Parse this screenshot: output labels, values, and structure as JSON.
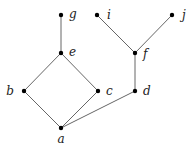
{
  "diagram": {
    "type": "hasse-diagram",
    "colors": {
      "edge": "#555555",
      "node": "#000000",
      "label": "#222222"
    },
    "nodes": [
      {
        "id": "a",
        "label": "a",
        "x": 61,
        "y": 128,
        "lx": 61,
        "ly": 143,
        "anchor": "middle"
      },
      {
        "id": "b",
        "label": "b",
        "x": 24,
        "y": 91,
        "lx": 14,
        "ly": 95,
        "anchor": "end"
      },
      {
        "id": "c",
        "label": "c",
        "x": 98,
        "y": 91,
        "lx": 106,
        "ly": 95,
        "anchor": "start"
      },
      {
        "id": "d",
        "label": "d",
        "x": 135,
        "y": 91,
        "lx": 143,
        "ly": 95,
        "anchor": "start"
      },
      {
        "id": "e",
        "label": "e",
        "x": 61,
        "y": 53,
        "lx": 69,
        "ly": 56,
        "anchor": "start"
      },
      {
        "id": "f",
        "label": "f",
        "x": 135,
        "y": 53,
        "lx": 143,
        "ly": 58,
        "anchor": "start"
      },
      {
        "id": "g",
        "label": "g",
        "x": 61,
        "y": 15,
        "lx": 69,
        "ly": 18,
        "anchor": "start"
      },
      {
        "id": "i",
        "label": "i",
        "x": 97,
        "y": 15,
        "lx": 107,
        "ly": 19,
        "anchor": "start"
      },
      {
        "id": "j",
        "label": "j",
        "x": 172,
        "y": 15,
        "lx": 182,
        "ly": 19,
        "anchor": "start"
      }
    ],
    "edges": [
      [
        "a",
        "b"
      ],
      [
        "a",
        "c"
      ],
      [
        "a",
        "d"
      ],
      [
        "b",
        "e"
      ],
      [
        "c",
        "e"
      ],
      [
        "e",
        "g"
      ],
      [
        "d",
        "f"
      ],
      [
        "f",
        "i"
      ],
      [
        "f",
        "j"
      ]
    ]
  }
}
